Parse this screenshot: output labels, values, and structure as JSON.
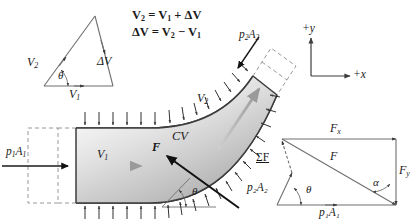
{
  "figure": {
    "kind": "fluid-mechanics-control-volume-diagram",
    "background_color": "#ffffff",
    "line_color": "#3c3c3c",
    "fluid_fill_light": "#f2f2f2",
    "fluid_fill_dark": "#b9b9b9",
    "dashed_color": "#8c8c8c"
  },
  "velocity_triangle": {
    "name": "velocity vector triangle",
    "labels": {
      "v1": "V",
      "v1_sub": "1",
      "v2": "V",
      "v2_sub": "2",
      "dv": "ΔV",
      "theta": "θ"
    }
  },
  "equations": {
    "line1_lhs": "V",
    "line1_lhs_sub": "2",
    "line1_eq": "=",
    "line1_rhs_a": "V",
    "line1_rhs_a_sub": "1",
    "line1_plus": "+",
    "line1_rhs_b": "ΔV",
    "line2_lhs": "ΔV",
    "line2_eq": "=",
    "line2_rhs_a": "V",
    "line2_rhs_a_sub": "2",
    "line2_minus": "−",
    "line2_rhs_b": "V",
    "line2_rhs_b_sub": "1",
    "full_line1": "V₂ = V₁ + ΔV",
    "full_line2": "ΔV = V₂ − V₁"
  },
  "axes": {
    "x_label": "+x",
    "y_label": "+y"
  },
  "control_volume": {
    "cv_label": "CV",
    "inlet_pressure_force": "p",
    "inlet_pressure_force_sub": "1",
    "inlet_pressure_area": "A",
    "inlet_pressure_area_sub": "1",
    "inlet_pressure_full": "p₁A₁",
    "outlet_pressure_full": "p₂A₂",
    "outlet_pressure_force": "p",
    "outlet_pressure_force_sub": "2",
    "outlet_pressure_area": "A",
    "outlet_pressure_area_sub": "2",
    "inlet_velocity": "V",
    "inlet_velocity_sub": "1",
    "outlet_velocity": "V",
    "outlet_velocity_sub": "2",
    "reaction_force": "F",
    "bend_angle": "θ"
  },
  "force_polygon": {
    "fx": "F",
    "fx_sub": "x",
    "fy": "F",
    "fy_sub": "y",
    "f_resultant": "F",
    "sum_f": "ΣF",
    "p1a1": "p₁A₁",
    "p2a2": "p₂A₂",
    "theta": "θ",
    "alpha": "α"
  }
}
